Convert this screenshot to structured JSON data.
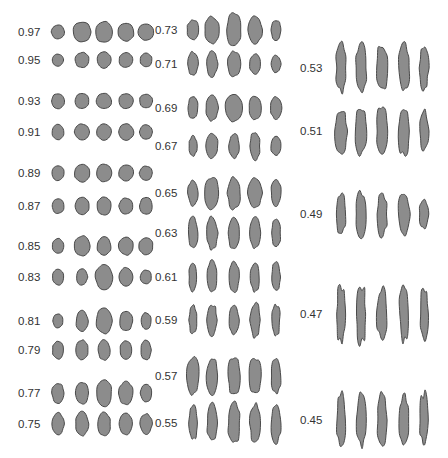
{
  "figure": {
    "colors": {
      "fill": "#8c8c8c",
      "stroke": "#4a4a4a",
      "text": "#333333",
      "background": "#ffffff"
    }
  },
  "columns": [
    {
      "label_x": 18,
      "shape_x": [
        58,
        82,
        104,
        126,
        146
      ],
      "rows": [
        {
          "value": "0.97",
          "y": 32,
          "shapes": [
            [
              13,
              14
            ],
            [
              18,
              20
            ],
            [
              17,
              21
            ],
            [
              16,
              18
            ],
            [
              16,
              16
            ]
          ]
        },
        {
          "value": "0.95",
          "y": 60,
          "shapes": [
            [
              11,
              12
            ],
            [
              14,
              15
            ],
            [
              14,
              16
            ],
            [
              14,
              15
            ],
            [
              12,
              14
            ]
          ]
        },
        {
          "value": "0.93",
          "y": 101,
          "shapes": [
            [
              13,
              15
            ],
            [
              14,
              15
            ],
            [
              15,
              15
            ],
            [
              14,
              15
            ],
            [
              13,
              14
            ]
          ]
        },
        {
          "value": "0.91",
          "y": 132,
          "shapes": [
            [
              12,
              15
            ],
            [
              15,
              16
            ],
            [
              15,
              16
            ],
            [
              15,
              16
            ],
            [
              13,
              14
            ]
          ]
        },
        {
          "value": "0.89",
          "y": 173,
          "shapes": [
            [
              12,
              15
            ],
            [
              15,
              18
            ],
            [
              15,
              18
            ],
            [
              15,
              16
            ],
            [
              13,
              14
            ]
          ]
        },
        {
          "value": "0.87",
          "y": 206,
          "shapes": [
            [
              12,
              15
            ],
            [
              14,
              18
            ],
            [
              14,
              18
            ],
            [
              14,
              16
            ],
            [
              13,
              17
            ]
          ]
        },
        {
          "value": "0.85",
          "y": 246,
          "shapes": [
            [
              11,
              15
            ],
            [
              16,
              20
            ],
            [
              14,
              18
            ],
            [
              15,
              18
            ],
            [
              14,
              17
            ]
          ]
        },
        {
          "value": "0.83",
          "y": 277,
          "shapes": [
            [
              11,
              16
            ],
            [
              11,
              16
            ],
            [
              17,
              25
            ],
            [
              14,
              19
            ],
            [
              11,
              14
            ]
          ]
        },
        {
          "value": "0.81",
          "y": 321,
          "shapes": [
            [
              10,
              14
            ],
            [
              12,
              20
            ],
            [
              16,
              25
            ],
            [
              13,
              20
            ],
            [
              10,
              17
            ]
          ]
        },
        {
          "value": "0.79",
          "y": 350,
          "shapes": [
            [
              11,
              18
            ],
            [
              12,
              20
            ],
            [
              12,
              20
            ],
            [
              12,
              18
            ],
            [
              10,
              20
            ]
          ]
        },
        {
          "value": "0.77",
          "y": 393,
          "shapes": [
            [
              12,
              20
            ],
            [
              13,
              22
            ],
            [
              15,
              28
            ],
            [
              14,
              23
            ],
            [
              11,
              18
            ]
          ]
        },
        {
          "value": "0.75",
          "y": 424,
          "shapes": [
            [
              12,
              22
            ],
            [
              13,
              24
            ],
            [
              13,
              23
            ],
            [
              13,
              21
            ],
            [
              12,
              20
            ]
          ]
        }
      ]
    },
    {
      "label_x": 155,
      "shape_x": [
        193,
        212,
        234,
        255,
        276
      ],
      "rows": [
        {
          "value": "0.73",
          "y": 30,
          "shapes": [
            [
              12,
              20
            ],
            [
              14,
              27
            ],
            [
              14,
              34
            ],
            [
              14,
              27
            ],
            [
              10,
              20
            ]
          ]
        },
        {
          "value": "0.71",
          "y": 64,
          "shapes": [
            [
              10,
              24
            ],
            [
              11,
              25
            ],
            [
              13,
              25
            ],
            [
              11,
              20
            ],
            [
              10,
              17
            ]
          ]
        },
        {
          "value": "0.69",
          "y": 108,
          "shapes": [
            [
              10,
              22
            ],
            [
              12,
              25
            ],
            [
              18,
              27
            ],
            [
              12,
              24
            ],
            [
              11,
              22
            ]
          ]
        },
        {
          "value": "0.67",
          "y": 146,
          "shapes": [
            [
              8,
              20
            ],
            [
              12,
              24
            ],
            [
              10,
              25
            ],
            [
              10,
              28
            ],
            [
              10,
              20
            ]
          ]
        },
        {
          "value": "0.65",
          "y": 193,
          "shapes": [
            [
              10,
              26
            ],
            [
              14,
              32
            ],
            [
              13,
              32
            ],
            [
              14,
              30
            ],
            [
              10,
              26
            ]
          ]
        },
        {
          "value": "0.63",
          "y": 233,
          "shapes": [
            [
              10,
              31
            ],
            [
              11,
              32
            ],
            [
              11,
              33
            ],
            [
              11,
              30
            ],
            [
              9,
              28
            ]
          ]
        },
        {
          "value": "0.61",
          "y": 277,
          "shapes": [
            [
              8,
              28
            ],
            [
              10,
              31
            ],
            [
              10,
              32
            ],
            [
              9,
              28
            ],
            [
              9,
              28
            ]
          ]
        },
        {
          "value": "0.59",
          "y": 320,
          "shapes": [
            [
              8,
              28
            ],
            [
              10,
              31
            ],
            [
              10,
              30
            ],
            [
              10,
              34
            ],
            [
              8,
              30
            ]
          ]
        },
        {
          "value": "0.57",
          "y": 376,
          "shapes": [
            [
              12,
              38
            ],
            [
              11,
              37
            ],
            [
              12,
              39
            ],
            [
              12,
              36
            ],
            [
              10,
              36
            ]
          ]
        },
        {
          "value": "0.55",
          "y": 423,
          "shapes": [
            [
              8,
              35
            ],
            [
              10,
              38
            ],
            [
              12,
              40
            ],
            [
              10,
              38
            ],
            [
              10,
              38
            ]
          ]
        }
      ]
    },
    {
      "label_x": 300,
      "shape_x": [
        341,
        361,
        382,
        404,
        424
      ],
      "rows": [
        {
          "value": "0.53",
          "y": 68,
          "shapes": [
            [
              10,
              47
            ],
            [
              11,
              47
            ],
            [
              11,
              47
            ],
            [
              11,
              47
            ],
            [
              9,
              44
            ]
          ]
        },
        {
          "value": "0.51",
          "y": 131,
          "shapes": [
            [
              12,
              43
            ],
            [
              12,
              48
            ],
            [
              11,
              49
            ],
            [
              11,
              49
            ],
            [
              9,
              42
            ]
          ]
        },
        {
          "value": "0.49",
          "y": 214,
          "shapes": [
            [
              9,
              42
            ],
            [
              10,
              45
            ],
            [
              10,
              45
            ],
            [
              11,
              46
            ],
            [
              9,
              30
            ]
          ]
        },
        {
          "value": "0.47",
          "y": 314,
          "shapes": [
            [
              9,
              57
            ],
            [
              10,
              57
            ],
            [
              10,
              56
            ],
            [
              9,
              56
            ],
            [
              8,
              52
            ]
          ]
        },
        {
          "value": "0.45",
          "y": 420,
          "shapes": [
            [
              9,
              53
            ],
            [
              9,
              53
            ],
            [
              9,
              53
            ],
            [
              9,
              53
            ],
            [
              8,
              53
            ]
          ]
        }
      ]
    }
  ]
}
